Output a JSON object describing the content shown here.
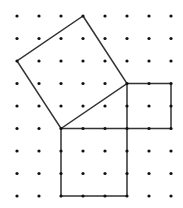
{
  "diagram": {
    "type": "dot-grid-geometry",
    "grid": {
      "columns": 8,
      "rows": 9,
      "origin_x": 17,
      "origin_y": 16,
      "spacing_x": 22,
      "spacing_y": 22.5,
      "dot_radius": 1.6,
      "dot_color": "#111111"
    },
    "line_color": "#333333",
    "line_width": 1.5,
    "shapes": [
      {
        "name": "tilted-square",
        "vertices_grid": [
          [
            3,
            0
          ],
          [
            5,
            3
          ],
          [
            2,
            5
          ],
          [
            0,
            2
          ]
        ]
      },
      {
        "name": "small-square",
        "vertices_grid": [
          [
            5,
            3
          ],
          [
            7,
            3
          ],
          [
            7,
            5
          ],
          [
            5,
            5
          ]
        ]
      },
      {
        "name": "large-square",
        "vertices_grid": [
          [
            2,
            5
          ],
          [
            5,
            5
          ],
          [
            5,
            8
          ],
          [
            2,
            8
          ]
        ]
      }
    ]
  }
}
